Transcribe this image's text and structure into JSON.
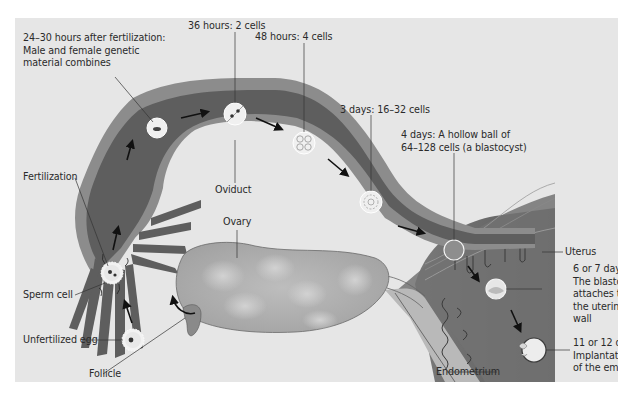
{
  "diagram": {
    "colors": {
      "background": "#e6e6e6",
      "page": "#ffffff",
      "oviduct_outer": "#8a8a8a",
      "oviduct_inner": "#5d5d5d",
      "ovary": "#a8a8a8",
      "uterus": "#6e6e6e",
      "text": "#2a2a2a"
    },
    "structures": {
      "oviduct": "Oviduct",
      "ovary": "Ovary",
      "uterus": "Uterus",
      "endometrium": "Endometrium",
      "follicle": "Follicle"
    },
    "cells": {
      "unfertilized_egg": "Unfertilized egg",
      "sperm_cell": "Sperm cell",
      "fertilization": "Fertilization"
    },
    "stages": [
      {
        "id": "s1",
        "label": "24–30 hours after fertilization:\nMale and female genetic\nmaterial combines"
      },
      {
        "id": "s2",
        "label": "36 hours: 2 cells"
      },
      {
        "id": "s3",
        "label": "48 hours: 4 cells"
      },
      {
        "id": "s4",
        "label": "3 days: 16–32 cells"
      },
      {
        "id": "s5",
        "label": "4 days: A hollow ball of\n64–128 cells (a blastocyst)"
      },
      {
        "id": "s6",
        "label": "6 or 7 days:\nThe blastocyst\nattaches to\nthe uterine\nwall"
      },
      {
        "id": "s7",
        "label": "11 or 12 days:\nImplantation\nof the embryo"
      }
    ]
  }
}
